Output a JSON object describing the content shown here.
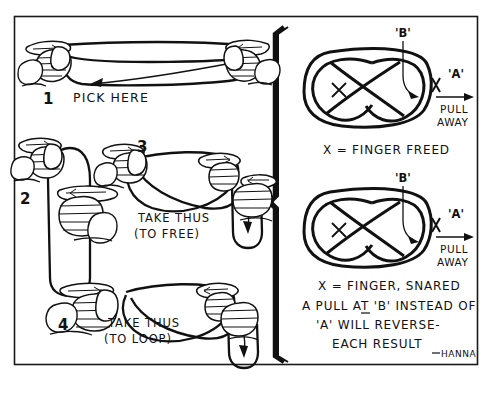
{
  "figure": {
    "signature": "HANNA",
    "border_color": "#1a1a1a",
    "ink_color": "#111111",
    "background_color": "#ffffff"
  },
  "left_panel": {
    "steps": [
      {
        "number": "1",
        "caption": "PICK HERE",
        "caption_line2": "",
        "description": "two hands holding a closed loop of string stretched horizontally, arrow pointing to lower strand"
      },
      {
        "number": "2",
        "caption": "",
        "caption_line2": "",
        "description": "hand holding a vertical hanging loop of string with second hand gripping below"
      },
      {
        "number": "3",
        "caption": "TAKE THUS",
        "caption_line2": "(TO FREE)",
        "description": "two hands crossing the string into a loop with a hanging bight at right"
      },
      {
        "number": "4",
        "caption": "TAKE THUS",
        "caption_line2": "(TO LOOP)",
        "description": "two hands crossing the string the opposite way with a hanging bight at right"
      }
    ]
  },
  "right_panel": {
    "diagrams": [
      {
        "label_b": "'B'",
        "label_a": "'A'",
        "pull_line1": "PULL",
        "pull_line2": "AWAY",
        "center_mark": "X",
        "result": "X = FINGER FREED"
      },
      {
        "label_b": "'B'",
        "label_a": "'A'",
        "pull_line1": "PULL",
        "pull_line2": "AWAY",
        "center_mark": "X",
        "result": "X = FINGER, SNARED",
        "note_lines": [
          "A PULL AT 'B' INSTEAD OF",
          "'A' WILL REVERSE-",
          "EACH RESULT"
        ]
      }
    ]
  }
}
